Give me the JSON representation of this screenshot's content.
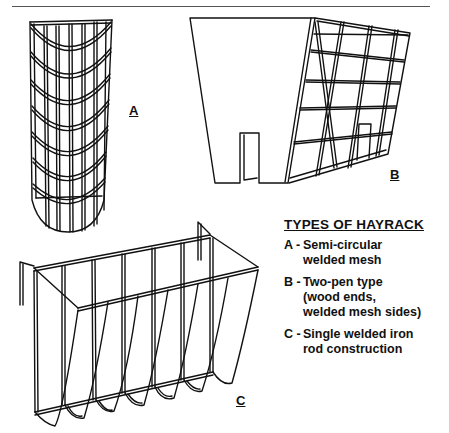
{
  "figure": {
    "labels": {
      "a": "A",
      "b": "B",
      "c": "C"
    },
    "legend": {
      "title": "TYPES OF HAYRACK",
      "items": [
        {
          "key": "A -",
          "lines": [
            "Semi-circular",
            "welded mesh"
          ]
        },
        {
          "key": "B -",
          "lines": [
            "Two-pen type",
            "(wood ends,",
            "welded mesh sides)"
          ]
        },
        {
          "key": "C -",
          "lines": [
            "Single welded iron",
            "rod construction"
          ]
        }
      ]
    },
    "colors": {
      "ink": "#111111",
      "background": "#ffffff"
    }
  }
}
